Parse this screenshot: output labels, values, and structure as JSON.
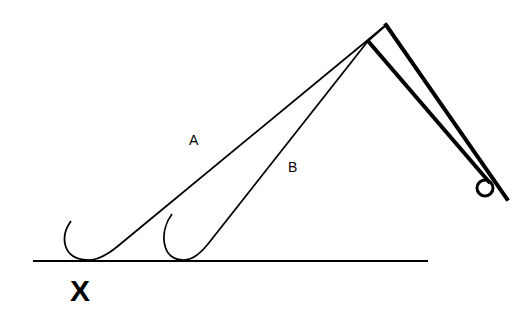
{
  "diagram": {
    "labels": {
      "a": "A",
      "b": "B",
      "x": "X"
    },
    "colors": {
      "stroke": "#000000",
      "background": "#ffffff"
    }
  }
}
